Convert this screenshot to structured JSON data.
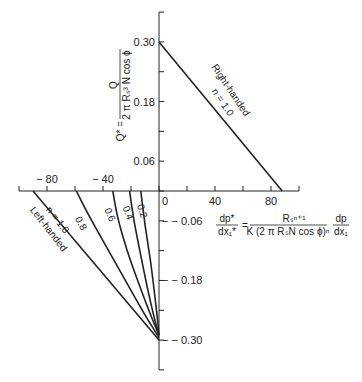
{
  "chart_data": {
    "type": "line",
    "title": "",
    "xlabel": "dp*/dx1* = R_s^(n+1) / (K (2 π R_s N cos φ)^n) · dp/dx1",
    "ylabel": "Q* = Q / (2 π R_s^3 N cos φ)",
    "x_ticks": [
      -100,
      -80,
      -60,
      -40,
      -20,
      0,
      20,
      40,
      60,
      80,
      100
    ],
    "x_tick_labels": [
      "-80",
      "-40",
      "0",
      "40",
      "80"
    ],
    "x_tick_label_values": [
      -80,
      -40,
      0,
      40,
      80
    ],
    "y_tick_labels": [
      "0.30",
      "0.18",
      "0.06",
      "-0.06",
      "-0.18",
      "-0.30"
    ],
    "y_tick_label_values": [
      0.3,
      0.18,
      0.06,
      -0.06,
      -0.18,
      -0.3
    ],
    "y_ticks": [
      0.36,
      0.3,
      0.24,
      0.18,
      0.12,
      0.06,
      0,
      -0.06,
      -0.12,
      -0.18,
      -0.24,
      -0.3,
      -0.36
    ],
    "xlim": [
      -100,
      100
    ],
    "ylim": [
      -0.36,
      0.36
    ],
    "grid": false,
    "series": [
      {
        "name": "Right-handed n = 1.0",
        "label_lines": [
          "Right-handed",
          "n = 1.0"
        ],
        "type": "straight",
        "x": [
          0,
          88
        ],
        "y": [
          0.3,
          0
        ]
      },
      {
        "name": "Left-handed n = 1.0",
        "label_lines": [
          "n = 1.0",
          "Left-handed"
        ],
        "type": "straight",
        "x": [
          -90,
          0
        ],
        "y": [
          0,
          -0.3
        ]
      },
      {
        "name": "n = 0.8",
        "label": "0.8",
        "type": "curve",
        "x": [
          -59,
          -52,
          -40,
          -24,
          -10,
          0
        ],
        "y": [
          0,
          -0.04,
          -0.1,
          -0.18,
          -0.25,
          -0.295
        ]
      },
      {
        "name": "n = 0.6",
        "label": "0.6",
        "type": "curve",
        "x": [
          -33,
          -30,
          -23,
          -14,
          -6,
          0
        ],
        "y": [
          0,
          -0.05,
          -0.12,
          -0.19,
          -0.25,
          -0.29
        ]
      },
      {
        "name": "n = 0.4",
        "label": "0.4",
        "type": "curve",
        "x": [
          -21,
          -18,
          -13,
          -8,
          -3,
          0
        ],
        "y": [
          0,
          -0.06,
          -0.13,
          -0.2,
          -0.26,
          -0.29
        ]
      },
      {
        "name": "n = 0.2",
        "label": "0.2",
        "type": "curve",
        "x": [
          -13,
          -10,
          -6,
          -3,
          -1,
          0
        ],
        "y": [
          0,
          -0.07,
          -0.14,
          -0.21,
          -0.26,
          -0.29
        ]
      }
    ],
    "formula_x": {
      "lhs_num": "dp*",
      "lhs_den": "dx1*",
      "num": "Rs n+1",
      "den": "K (2 π RsN cos φ)n",
      "rhs_num": "dp",
      "rhs_den": "dx1"
    },
    "formula_y": {
      "lhs": "Q* =",
      "num": "Q",
      "den": "2 π Rs3 N cos φ"
    }
  }
}
